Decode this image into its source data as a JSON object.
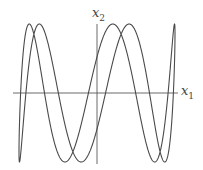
{
  "figure": {
    "type": "lissajous",
    "x_axis_label": "x",
    "x_axis_sub": "1",
    "y_axis_label": "x",
    "y_axis_sub": "2",
    "colors": {
      "curve": "#4a4a4a",
      "axis": "#5a5a5a",
      "background": "#ffffff"
    },
    "params": {
      "freq_x": 1,
      "freq_y": 5,
      "phase": 0.55,
      "amp_x": 78,
      "amp_y": 69,
      "cx": 97,
      "cy": 93
    },
    "axes": {
      "x_from": 13,
      "x_to": 178,
      "y_from": 24,
      "y_to": 164
    }
  }
}
